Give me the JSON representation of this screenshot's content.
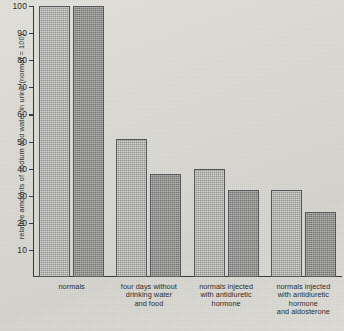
{
  "chart_data": {
    "type": "bar",
    "title": "",
    "xlabel": "",
    "ylabel": "relative amounts of sodium and water in urine (normal = 100)",
    "ylim": [
      0,
      100
    ],
    "yticks": [
      10,
      20,
      30,
      40,
      50,
      60,
      70,
      80,
      90,
      100
    ],
    "grid": false,
    "legend_position": "none",
    "categories": [
      "normals",
      "four days without drinking water and food",
      "normals injected with antidiuretic hormone",
      "normals injected with antidiuretic hormone and aldosterone"
    ],
    "category_lines": [
      [
        "normals"
      ],
      [
        "four days without",
        "drinking water",
        "and food"
      ],
      [
        "normals injected",
        "with antidiuretic",
        "hormone"
      ],
      [
        "normals injected",
        "with antidiuretic",
        "hormone",
        "and aldosterone"
      ]
    ],
    "series": [
      {
        "name": "sodium",
        "shade": "light",
        "values": [
          100,
          51,
          40,
          32
        ]
      },
      {
        "name": "water",
        "shade": "dark",
        "values": [
          100,
          38,
          32,
          24
        ]
      }
    ],
    "colors": {
      "bar_light": "#a3a3a0",
      "bar_dark": "#8a8a88",
      "bar_outline": "#57575a",
      "axis": "#3a3a38",
      "background": "#dcdbd6",
      "text": "#2d2d2b"
    }
  }
}
